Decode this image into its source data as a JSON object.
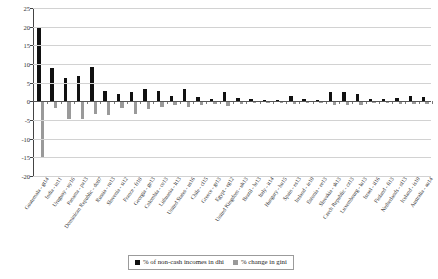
{
  "chart_data": {
    "type": "bar",
    "title": "",
    "xlabel": "",
    "ylabel": "",
    "ylim": [
      -20,
      25
    ],
    "ytick_values": [
      25,
      20,
      15,
      10,
      5,
      0,
      -5,
      -10,
      -15,
      -20
    ],
    "ytick_labels": [
      "25",
      "20",
      "15",
      "10",
      "5",
      "0",
      "-5",
      "-10",
      "-15",
      "-20"
    ],
    "grid": true,
    "legend_position": "bottom-center",
    "categories": [
      "Guatemala - gt14",
      "India - in11",
      "Uruguay - uy16",
      "Panama - pa13",
      "Dominican Republic - do07",
      "Russia - ru13",
      "Slovenia - si12",
      "France - fr10",
      "Georgia - ge13",
      "Colombia - co13",
      "Lithuania - lt13",
      "United States - us16",
      "Chile - cl15",
      "Greece - gr13",
      "Egypt - eg12",
      "United Kingdom - uk13",
      "Brazil - br13",
      "Italy - it14",
      "Hungary - hu15",
      "Spain - es13",
      "Ireland - ie10",
      "Estonia - ee13",
      "Slovakia - sk13",
      "Czech Republic - cz13",
      "Luxembourg - lu13",
      "Israel - il16",
      "Finland - fi13",
      "Netherlands - nl13",
      "Iceland - is10",
      "Australia - au14"
    ],
    "series": [
      {
        "name": "% of non-cash incomes in dhi",
        "color": "#111111",
        "values": [
          19.6,
          8.8,
          6.2,
          6.8,
          9.3,
          2.8,
          1.9,
          2.4,
          3.3,
          2.9,
          1.4,
          3.2,
          1.2,
          0.5,
          2.6,
          0.9,
          0.5,
          0.4,
          0.3,
          1.4,
          0.6,
          0.4,
          2.6,
          2.5,
          2.0,
          0.6,
          0.5,
          0.8,
          1.5,
          1.2
        ]
      },
      {
        "name": "% change in gini",
        "color": "#9a9a9a",
        "values": [
          -15.2,
          -1.8,
          -4.8,
          -4.7,
          -3.4,
          -3.6,
          -1.8,
          -3.3,
          -2.1,
          -1.5,
          -1.1,
          -1.4,
          -1.0,
          -0.7,
          -1.2,
          -0.7,
          -0.5,
          -0.4,
          -0.4,
          -0.8,
          -0.5,
          -0.4,
          -1.0,
          -1.1,
          -0.9,
          -0.5,
          -0.4,
          -0.6,
          -0.8,
          -0.7
        ]
      }
    ]
  },
  "legend": {
    "items": [
      {
        "label": "% of non-cash incomes in dhi",
        "swatch": "black"
      },
      {
        "label": "% change in gini",
        "swatch": "gray"
      }
    ]
  }
}
